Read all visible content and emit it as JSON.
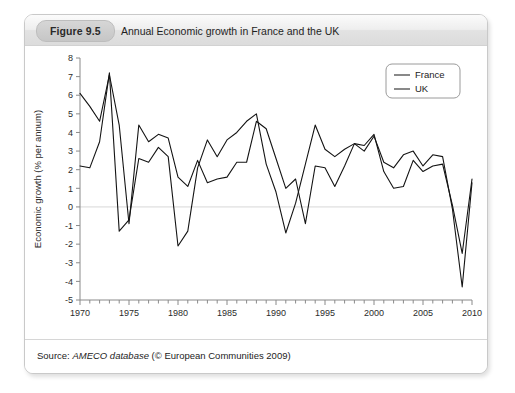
{
  "figure": {
    "badge": "Figure 9.5",
    "title": "Annual Economic growth in France and the UK"
  },
  "source": {
    "prefix": "Source:",
    "database": "AMECO database",
    "credit": "(© European Communities 2009)"
  },
  "chart_data": {
    "type": "line",
    "title": "Annual Economic growth in France and the UK",
    "xlabel": "",
    "ylabel": "Economic growth (% per annum)",
    "xlim": [
      1970,
      2010
    ],
    "ylim": [
      -5,
      8
    ],
    "yticks": [
      8,
      7,
      6,
      5,
      4,
      3,
      2,
      1,
      0,
      -1,
      -2,
      -3,
      -4,
      -5
    ],
    "xticks": [
      1970,
      1975,
      1980,
      1985,
      1990,
      1995,
      2000,
      2005,
      2010
    ],
    "xtick_minor_step": 1,
    "grid": "zero-line-only",
    "legend_position": "top-right",
    "x": [
      1970,
      1971,
      1972,
      1973,
      1974,
      1975,
      1976,
      1977,
      1978,
      1979,
      1980,
      1981,
      1982,
      1983,
      1984,
      1985,
      1986,
      1987,
      1988,
      1989,
      1990,
      1991,
      1992,
      1993,
      1994,
      1995,
      1996,
      1997,
      1998,
      1999,
      2000,
      2001,
      2002,
      2003,
      2004,
      2005,
      2006,
      2007,
      2008,
      2009,
      2010
    ],
    "series": [
      {
        "name": "France",
        "color": "#141414",
        "values": [
          6.1,
          5.4,
          4.6,
          7.1,
          4.4,
          -0.9,
          4.4,
          3.5,
          3.9,
          3.7,
          1.6,
          1.1,
          2.5,
          1.3,
          1.5,
          1.6,
          2.4,
          2.4,
          4.6,
          4.2,
          2.6,
          1.0,
          1.5,
          -0.9,
          2.2,
          2.1,
          1.1,
          2.2,
          3.4,
          3.3,
          3.9,
          1.9,
          1.0,
          1.1,
          2.5,
          1.9,
          2.2,
          2.3,
          0.1,
          -2.5,
          1.5
        ]
      },
      {
        "name": "UK",
        "color": "#141414",
        "values": [
          2.2,
          2.1,
          3.5,
          7.2,
          -1.3,
          -0.7,
          2.6,
          2.4,
          3.2,
          2.7,
          -2.1,
          -1.3,
          2.1,
          3.6,
          2.7,
          3.6,
          4.0,
          4.6,
          5.0,
          2.3,
          0.8,
          -1.4,
          0.2,
          2.3,
          4.4,
          3.1,
          2.7,
          3.1,
          3.4,
          3.0,
          3.8,
          2.4,
          2.1,
          2.8,
          3.0,
          2.2,
          2.8,
          2.7,
          -0.1,
          -4.3,
          1.3
        ]
      }
    ]
  }
}
